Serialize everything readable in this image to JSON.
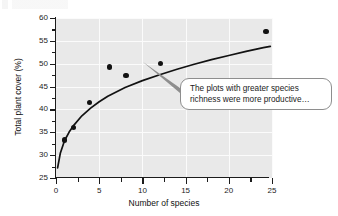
{
  "chart_data": {
    "type": "scatter",
    "title": "",
    "xlabel": "Number of species",
    "ylabel": "Total plant cover (%)",
    "xlim": [
      0,
      25
    ],
    "ylim": [
      25,
      60
    ],
    "xticks": [
      "0",
      "5",
      "10",
      "15",
      "20",
      "25"
    ],
    "xtick_values": [
      0,
      5,
      10,
      15,
      20,
      25
    ],
    "yticks": [
      "25",
      "30",
      "35",
      "40",
      "45",
      "50",
      "55",
      "60"
    ],
    "ytick_values": [
      25,
      30,
      35,
      40,
      45,
      50,
      55,
      60
    ],
    "grid": true,
    "legend": "none",
    "points": [
      {
        "x": 1.0,
        "y": 33.3
      },
      {
        "x": 2.0,
        "y": 36.0
      },
      {
        "x": 3.9,
        "y": 41.5
      },
      {
        "x": 6.2,
        "y": 49.3
      },
      {
        "x": 8.1,
        "y": 47.4
      },
      {
        "x": 12.1,
        "y": 50.1
      },
      {
        "x": 24.3,
        "y": 57.0
      }
    ],
    "fit_curve": {
      "type": "logarithmic",
      "label": "fitted trend line",
      "points": [
        {
          "x": 0.18,
          "y": 27.2
        },
        {
          "x": 0.5,
          "y": 30.4
        },
        {
          "x": 1.0,
          "y": 33.2
        },
        {
          "x": 1.5,
          "y": 35.0
        },
        {
          "x": 2.0,
          "y": 36.4
        },
        {
          "x": 3.0,
          "y": 38.6
        },
        {
          "x": 4.0,
          "y": 40.3
        },
        {
          "x": 5.0,
          "y": 41.7
        },
        {
          "x": 6.0,
          "y": 42.9
        },
        {
          "x": 8.0,
          "y": 44.8
        },
        {
          "x": 10.0,
          "y": 46.3
        },
        {
          "x": 12.0,
          "y": 47.6
        },
        {
          "x": 14.0,
          "y": 48.8
        },
        {
          "x": 16.0,
          "y": 49.9
        },
        {
          "x": 18.0,
          "y": 50.9
        },
        {
          "x": 20.0,
          "y": 51.8
        },
        {
          "x": 22.0,
          "y": 52.7
        },
        {
          "x": 24.0,
          "y": 53.5
        },
        {
          "x": 24.8,
          "y": 53.8
        }
      ]
    },
    "annotations": [
      {
        "text": "The plots with greater species\nrichness were more productive…",
        "anchor_x": 10.1,
        "anchor_y": 46.0,
        "style": "rounded-callout"
      }
    ]
  },
  "callout": {
    "text": "The plots with greater species\nrichness were more productive…"
  },
  "axes": {
    "x_title": "Number of species",
    "y_title": "Total plant cover (%)"
  }
}
